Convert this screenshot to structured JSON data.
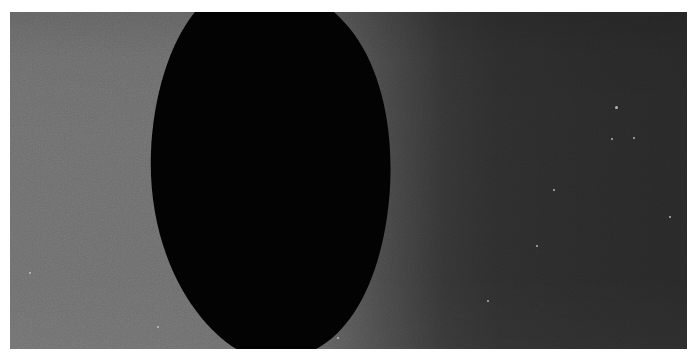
{
  "image": {
    "title": "Dark occulting disc silhouetted against a luminance-gradient sky",
    "kind": "natural-image",
    "width_px": 697,
    "height_px": 359,
    "frame": {
      "margin_color": "#ffffff",
      "content_left_px": 10,
      "content_top_px": 12,
      "content_width_px": 677,
      "content_height_px": 337
    }
  },
  "palette": {
    "margin_white": "#ffffff",
    "background_left_gray": "#6e6e6e",
    "background_mid_gray": "#464646",
    "background_right_dark": "#282828",
    "silhouette_black": "#030303",
    "speck_light": "#cfcfcf"
  },
  "background": {
    "description": "Horizontal gradient from medium gray on the left to near-black on the right",
    "gradient_direction": "left-to-right",
    "stops": [
      {
        "pos_pct": 0,
        "color": "#6e6e6e"
      },
      {
        "pos_pct": 22,
        "color": "#6d6d6d"
      },
      {
        "pos_pct": 34,
        "color": "#6a6a6a"
      },
      {
        "pos_pct": 46,
        "color": "#5e5e5e"
      },
      {
        "pos_pct": 56,
        "color": "#464646"
      },
      {
        "pos_pct": 64,
        "color": "#343434"
      },
      {
        "pos_pct": 72,
        "color": "#2d2d2d"
      },
      {
        "pos_pct": 84,
        "color": "#2a2a2a"
      },
      {
        "pos_pct": 100,
        "color": "#282828"
      }
    ]
  },
  "silhouette": {
    "name": "dark-oval-blob",
    "description": "Large solid black rounded blob, slightly egg shaped, tilted; occupies the centre-left of the frame and is clipped by the top and bottom edges",
    "fill": "#030303",
    "bounds_px": {
      "left": 147,
      "top": 0,
      "right": 380,
      "bottom": 337
    },
    "leftmost_point_px": {
      "x": 147,
      "y": 203
    },
    "rightmost_point_px": {
      "x": 380,
      "y": 120
    },
    "path": "M 206 0 C 150 40 130 110 140 175 C 150 250 200 320 265 337 L 300 337 C 350 310 378 250 380 175 C 382 95 345 25 290 0 Z"
  },
  "specks": [
    {
      "name": "speck-1",
      "x": 20,
      "y": 261,
      "r": 1.4
    },
    {
      "name": "speck-2",
      "x": 148,
      "y": 315,
      "r": 1.4
    },
    {
      "name": "speck-3",
      "x": 606,
      "y": 95,
      "r": 1.5
    },
    {
      "name": "speck-4",
      "x": 602,
      "y": 127,
      "r": 1.3
    },
    {
      "name": "speck-5",
      "x": 624,
      "y": 126,
      "r": 1.4
    },
    {
      "name": "speck-6",
      "x": 527,
      "y": 234,
      "r": 1.3
    },
    {
      "name": "speck-7",
      "x": 544,
      "y": 178,
      "r": 1.0
    },
    {
      "name": "speck-8",
      "x": 478,
      "y": 289,
      "r": 1.0
    },
    {
      "name": "speck-9",
      "x": 328,
      "y": 326,
      "r": 1.0
    },
    {
      "name": "speck-10",
      "x": 660,
      "y": 205,
      "r": 1.0
    }
  ]
}
